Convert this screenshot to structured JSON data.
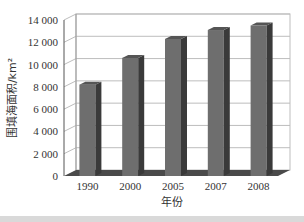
{
  "chart_data": {
    "type": "bar",
    "style": "3d-column",
    "title": "",
    "xlabel": "年份",
    "ylabel": "围填海面积/km²",
    "categories": [
      "1990",
      "2000",
      "2005",
      "2007",
      "2008"
    ],
    "values": [
      8200,
      10600,
      12300,
      13100,
      13500
    ],
    "ylim": [
      0,
      14000
    ],
    "yticks": [
      0,
      2000,
      4000,
      6000,
      8000,
      10000,
      12000,
      14000
    ],
    "ytick_labels": [
      "0",
      "2 000",
      "4 000",
      "6 000",
      "8 000",
      "10 000",
      "12 000",
      "14 000"
    ],
    "grid": true,
    "legend": null,
    "colors": {
      "bar_front": "#6e6e6e",
      "bar_side": "#3a3a3a",
      "bar_top": "#555555",
      "grid": "#bdbdbd",
      "floor": "#4a4a4a"
    }
  }
}
